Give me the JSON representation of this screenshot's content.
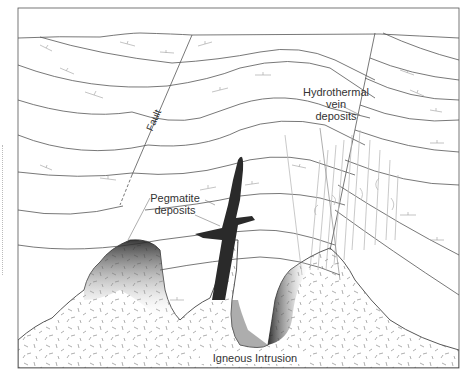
{
  "figure": {
    "type": "geologic cross-section",
    "labels": {
      "fault": "Fault",
      "hydrothermal": [
        "Hydrothermal",
        "vein",
        "deposits"
      ],
      "pegmatite": [
        "Pegmatite",
        "deposits"
      ],
      "igneous": "Igneous Intrusion"
    },
    "colors": {
      "line": "#555555",
      "vein": "#b8b8b8",
      "pegmatite": "#2a2a2a",
      "intrusion_fill": "#ffffff",
      "stipple": "#777777"
    }
  }
}
